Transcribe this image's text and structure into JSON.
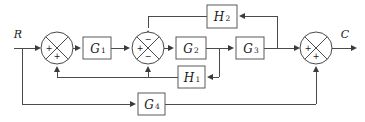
{
  "diagram": {
    "kind": "control-system-block-diagram",
    "title": "",
    "background_color": "#ffffff",
    "line_color": "#4a4a4a",
    "text_color": "#1a1a1a",
    "io": {
      "input_label": "R",
      "output_label": "C"
    },
    "blocks": [
      {
        "id": "G1",
        "label": "G",
        "subscript": "1",
        "full": "G1",
        "x": 83,
        "y": 37,
        "w": 28,
        "h": 22
      },
      {
        "id": "G2",
        "label": "G",
        "subscript": "2",
        "full": "G2",
        "x": 176,
        "y": 37,
        "w": 30,
        "h": 22
      },
      {
        "id": "G3",
        "label": "G",
        "subscript": "3",
        "full": "G3",
        "x": 236,
        "y": 37,
        "w": 28,
        "h": 22
      },
      {
        "id": "G4",
        "label": "G",
        "subscript": "4",
        "full": "G4",
        "x": 138,
        "y": 93,
        "w": 27,
        "h": 22
      },
      {
        "id": "H1",
        "label": "H",
        "subscript": "1",
        "full": "H1",
        "x": 178,
        "y": 66,
        "w": 27,
        "h": 22
      },
      {
        "id": "H2",
        "label": "H",
        "subscript": "2",
        "full": "H2",
        "x": 207,
        "y": 5,
        "w": 30,
        "h": 23
      }
    ],
    "summing_junctions": [
      {
        "id": "sum1",
        "cx": 57,
        "cy": 48,
        "r": 16,
        "signs": {
          "left": "+",
          "bottom": "+",
          "top": "",
          "right": ""
        }
      },
      {
        "id": "sum2",
        "cx": 148,
        "cy": 48,
        "r": 16,
        "signs": {
          "left": "+",
          "bottom": "−",
          "top": "−",
          "right": ""
        }
      },
      {
        "id": "sum3",
        "cx": 316,
        "cy": 48,
        "r": 16,
        "signs": {
          "left": "+",
          "bottom": "+",
          "top": "",
          "right": ""
        }
      }
    ],
    "signal_paths": [
      {
        "from": "R",
        "to": "sum1",
        "type": "forward"
      },
      {
        "from": "R",
        "to": "G4",
        "type": "feedforward-branch"
      },
      {
        "from": "sum1",
        "to": "G1",
        "type": "forward"
      },
      {
        "from": "G1",
        "to": "sum2",
        "type": "forward"
      },
      {
        "from": "sum2",
        "to": "G2",
        "type": "forward"
      },
      {
        "from": "G2",
        "to": "G3",
        "type": "forward"
      },
      {
        "from": "G2",
        "to": "H1",
        "type": "feedback-branch"
      },
      {
        "from": "G3",
        "to": "sum3",
        "type": "forward"
      },
      {
        "from": "G3",
        "to": "H2",
        "type": "feedback-branch"
      },
      {
        "from": "H2",
        "to": "sum2",
        "type": "feedback"
      },
      {
        "from": "H1",
        "to": "sum2",
        "type": "feedback"
      },
      {
        "from": "H1",
        "to": "sum1",
        "type": "feedback"
      },
      {
        "from": "G4",
        "to": "sum3",
        "type": "feedforward"
      },
      {
        "from": "sum3",
        "to": "C",
        "type": "output"
      }
    ]
  }
}
